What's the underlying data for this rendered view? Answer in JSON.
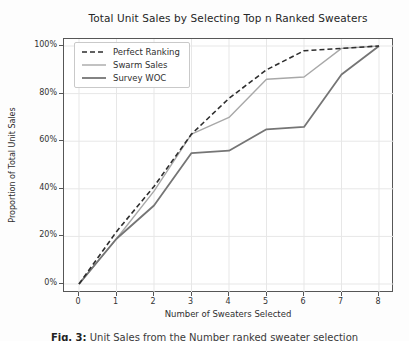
{
  "title": "Total Unit Sales by Selecting Top n Ranked Sweaters",
  "axes": {
    "xlabel": "Number of Sweaters Selected",
    "ylabel": "Proportion of Total Unit Sales",
    "x_tick_labels": [
      "0",
      "1",
      "2",
      "3",
      "4",
      "5",
      "6",
      "7",
      "8"
    ],
    "y_tick_labels": [
      "0%",
      "20%",
      "40%",
      "60%",
      "80%",
      "100%"
    ],
    "y_tick_values": [
      0,
      20,
      40,
      60,
      80,
      100
    ]
  },
  "caption": {
    "label": "Fig. 3:",
    "text": "Unit Sales from the Number ranked sweater selection"
  },
  "colors": {
    "grid": "#e7e7e7",
    "spine": "#565656",
    "background": "#ffffff"
  },
  "chart_data": {
    "type": "line",
    "title": "Total Unit Sales by Selecting Top n Ranked Sweaters",
    "xlabel": "Number of Sweaters Selected",
    "ylabel": "Proportion of Total Unit Sales",
    "x": [
      0,
      1,
      2,
      3,
      4,
      5,
      6,
      7,
      8
    ],
    "xlim": [
      0,
      8
    ],
    "ylim": [
      0,
      100
    ],
    "grid": true,
    "legend_position": "upper left",
    "series": [
      {
        "name": "Perfect Ranking",
        "values": [
          0,
          22,
          41,
          63,
          78,
          90,
          98,
          99,
          100
        ],
        "color": "#2e2e2e",
        "dash": "5 3",
        "width": 1.6
      },
      {
        "name": "Swarm Sales",
        "values": [
          0,
          19,
          39,
          63,
          70,
          86,
          87,
          99,
          100
        ],
        "color": "#a8a8a8",
        "dash": null,
        "width": 1.4
      },
      {
        "name": "Survey WOC",
        "values": [
          0,
          19,
          33,
          55,
          56,
          65,
          66,
          88,
          100
        ],
        "color": "#757575",
        "dash": null,
        "width": 1.8
      }
    ]
  }
}
